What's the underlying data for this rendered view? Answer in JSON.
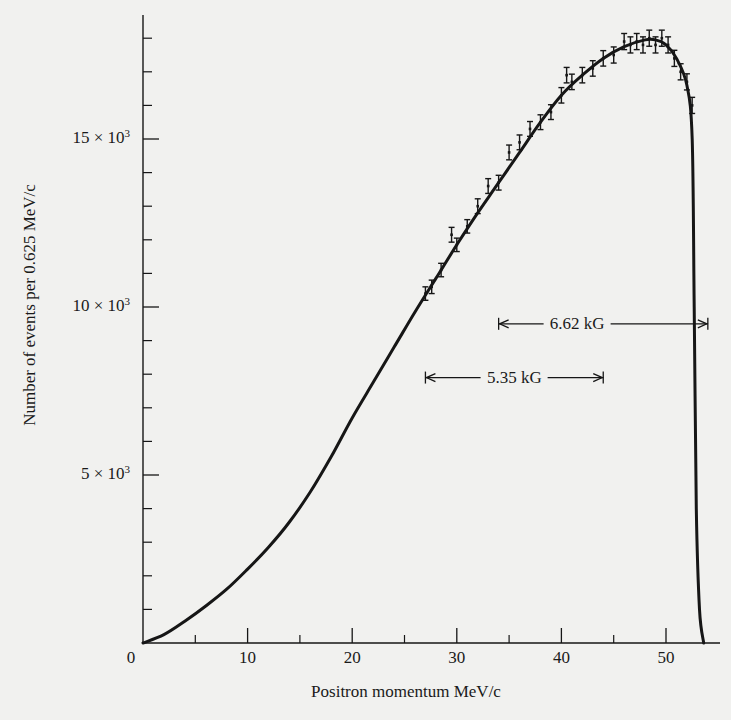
{
  "chart_data": {
    "type": "line",
    "title": "",
    "xlabel": "Positron momentum MeV/c",
    "ylabel": "Number of events per 0.625 MeV/c",
    "xlim": [
      0,
      55
    ],
    "ylim": [
      0,
      18500
    ],
    "grid": false,
    "legend": null,
    "x_ticks": [
      {
        "value": 0,
        "label": "0"
      },
      {
        "value": 10,
        "label": "10"
      },
      {
        "value": 20,
        "label": "20"
      },
      {
        "value": 30,
        "label": "30"
      },
      {
        "value": 40,
        "label": "40"
      },
      {
        "value": 50,
        "label": "50"
      }
    ],
    "x_minor_ticks": [
      5,
      15,
      25,
      35,
      45
    ],
    "y_ticks": [
      {
        "value": 5000,
        "label_main": "5 × 10",
        "label_exp": "3"
      },
      {
        "value": 10000,
        "label_main": "10 × 10",
        "label_exp": "3"
      },
      {
        "value": 15000,
        "label_main": "15 × 10",
        "label_exp": "3"
      }
    ],
    "y_minor_ticks": [
      1000,
      2000,
      3000,
      4000,
      6000,
      7000,
      8000,
      9000,
      11000,
      12000,
      13000,
      14000,
      16000,
      17000,
      18000
    ],
    "series": [
      {
        "name": "Theoretical spectrum (fit curve)",
        "kind": "line",
        "x": [
          0,
          2,
          4,
          6,
          8,
          10,
          12,
          14,
          16,
          18,
          20,
          22,
          24,
          26,
          28,
          30,
          32,
          34,
          36,
          38,
          40,
          42,
          44,
          46,
          48,
          49,
          50,
          51,
          52,
          52.5,
          52.7,
          52.9,
          53.2,
          53.6
        ],
        "values": [
          0,
          250,
          650,
          1100,
          1600,
          2200,
          2850,
          3600,
          4500,
          5550,
          6700,
          7750,
          8800,
          9850,
          10850,
          11850,
          12800,
          13700,
          14600,
          15500,
          16300,
          16900,
          17400,
          17750,
          17950,
          17950,
          17800,
          17400,
          16600,
          15000,
          10000,
          4000,
          1000,
          0
        ]
      },
      {
        "name": "Measured data (with error bars)",
        "kind": "errorbar",
        "x": [
          27,
          27.6,
          28.5,
          29.5,
          30,
          31,
          32,
          33,
          34,
          35,
          36,
          37,
          38,
          39,
          40,
          40.5,
          41,
          42,
          43,
          44,
          45,
          46,
          46.6,
          47.2,
          47.8,
          48.4,
          49,
          49.6,
          50.2,
          50.8,
          51.4,
          52.0,
          52.5
        ],
        "values": [
          10400,
          10600,
          11100,
          12150,
          11850,
          12400,
          13000,
          13600,
          13700,
          14600,
          14900,
          15300,
          15500,
          15800,
          16300,
          16900,
          16700,
          16900,
          17100,
          17400,
          17500,
          17900,
          17800,
          17900,
          17800,
          18000,
          17800,
          18000,
          17800,
          17400,
          17000,
          16700,
          16000
        ],
        "error": [
          200,
          200,
          200,
          220,
          200,
          200,
          220,
          220,
          220,
          220,
          220,
          220,
          220,
          220,
          230,
          230,
          230,
          230,
          230,
          230,
          240,
          240,
          240,
          240,
          240,
          240,
          240,
          240,
          240,
          240,
          240,
          240,
          240
        ]
      }
    ],
    "annotations": [
      {
        "label": "5.35 kG",
        "x_start": 27,
        "x_end": 44,
        "y": 7900,
        "text_x": 35.5
      },
      {
        "label": "6.62 kG",
        "x_start": 34,
        "x_end": 54,
        "y": 9500,
        "text_x": 41.5
      }
    ]
  }
}
